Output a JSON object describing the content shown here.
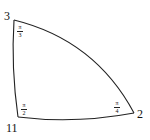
{
  "diagram": {
    "type": "geodesic-triangle",
    "stroke_color": "#222222",
    "vertices": [
      {
        "id": "top-left",
        "label": "3",
        "x": 14,
        "y": 20
      },
      {
        "id": "bottom-left",
        "label": "11",
        "x": 18,
        "y": 117
      },
      {
        "id": "right",
        "label": "2",
        "x": 134,
        "y": 113
      }
    ],
    "angles": [
      {
        "vertex": "top-left",
        "numerator": "π",
        "denominator": "3"
      },
      {
        "vertex": "bottom-left",
        "numerator": "π",
        "denominator": "2"
      },
      {
        "vertex": "right",
        "numerator": "π",
        "denominator": "4"
      }
    ]
  }
}
